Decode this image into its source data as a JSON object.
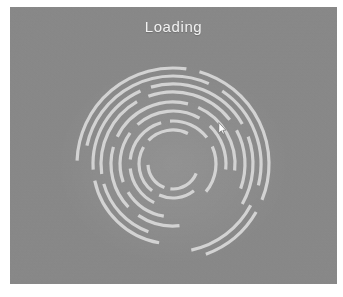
{
  "window": {
    "title": "Loading",
    "background_color": "#ffffff",
    "panel_color": "#888888",
    "panel_rect": {
      "x": 10,
      "y": 7,
      "width": 327,
      "height": 277
    }
  },
  "header": {
    "title": "Loading",
    "title_color": "#f2f2f2"
  },
  "spinner": {
    "name": "loading-spinner",
    "status_text": "Loading",
    "arc_color": "#d9d9d9",
    "center": {
      "x": 163,
      "y": 157
    },
    "stroke_width": 3.2,
    "ring_count": 9,
    "rings": [
      {
        "radius": 96,
        "arcs": [
          {
            "start": 272,
            "end": 8
          },
          {
            "start": 16,
            "end": 112
          },
          {
            "start": 120,
            "end": 160
          }
        ]
      },
      {
        "radius": 88,
        "arcs": [
          {
            "start": 282,
            "end": 24
          },
          {
            "start": 34,
            "end": 104
          },
          {
            "start": 118,
            "end": 168
          }
        ]
      },
      {
        "radius": 80,
        "arcs": [
          {
            "start": 190,
            "end": 258
          },
          {
            "start": 266,
            "end": 336
          },
          {
            "start": 344,
            "end": 60
          },
          {
            "start": 70,
            "end": 120
          }
        ]
      },
      {
        "radius": 72,
        "arcs": [
          {
            "start": 200,
            "end": 254
          },
          {
            "start": 262,
            "end": 330
          },
          {
            "start": 340,
            "end": 52
          },
          {
            "start": 62,
            "end": 110
          }
        ]
      },
      {
        "radius": 62,
        "arcs": [
          {
            "start": 174,
            "end": 214
          },
          {
            "start": 226,
            "end": 286
          },
          {
            "start": 296,
            "end": 14
          },
          {
            "start": 24,
            "end": 96
          }
        ]
      },
      {
        "radius": 53,
        "arcs": [
          {
            "start": 190,
            "end": 238
          },
          {
            "start": 250,
            "end": 306
          },
          {
            "start": 318,
            "end": 30
          },
          {
            "start": 44,
            "end": 96
          }
        ]
      },
      {
        "radius": 43,
        "arcs": [
          {
            "start": 206,
            "end": 264
          },
          {
            "start": 276,
            "end": 344
          },
          {
            "start": 356,
            "end": 52
          },
          {
            "start": 66,
            "end": 130
          }
        ]
      },
      {
        "radius": 34,
        "arcs": [
          {
            "start": 142,
            "end": 204
          },
          {
            "start": 218,
            "end": 300
          },
          {
            "start": 314,
            "end": 26
          }
        ]
      },
      {
        "radius": 25,
        "arcs": [
          {
            "start": 112,
            "end": 186
          },
          {
            "start": 200,
            "end": 268
          }
        ]
      }
    ]
  },
  "cursor": {
    "name": "mouse-pointer",
    "x": 208,
    "y": 115,
    "color": "#ffffff"
  }
}
